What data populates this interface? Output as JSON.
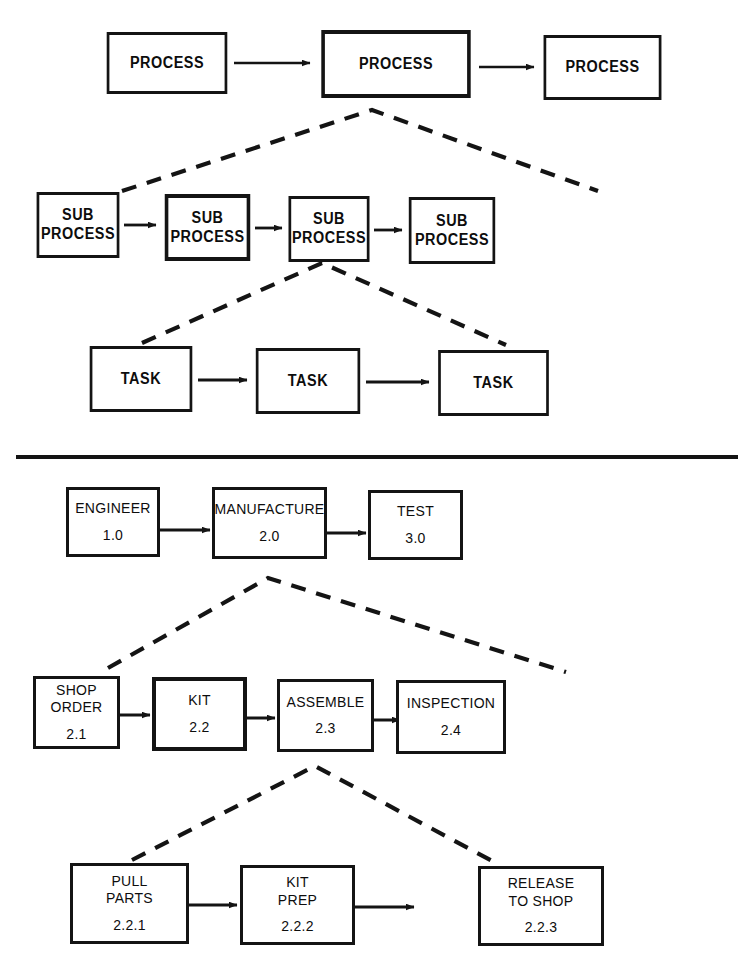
{
  "diagram": {
    "background_color": "#ffffff",
    "line_color": "#141414",
    "upper": {
      "caption": "Generic process hierarchy",
      "levels": [
        {
          "name": "process-level",
          "nodes": [
            {
              "label": "PROCESS"
            },
            {
              "label": "PROCESS"
            },
            {
              "label": "PROCESS"
            }
          ]
        },
        {
          "name": "sub-process-level",
          "nodes": [
            {
              "label_line1": "SUB",
              "label_line2": "PROCESS"
            },
            {
              "label_line1": "SUB",
              "label_line2": "PROCESS"
            },
            {
              "label_line1": "SUB",
              "label_line2": "PROCESS"
            },
            {
              "label_line1": "SUB",
              "label_line2": "PROCESS"
            }
          ]
        },
        {
          "name": "task-level",
          "nodes": [
            {
              "label": "TASK"
            },
            {
              "label": "TASK"
            },
            {
              "label": "TASK"
            }
          ]
        }
      ]
    },
    "lower": {
      "caption": "Worked example: manufacturing decomposition",
      "levels": [
        {
          "name": "level-1",
          "nodes": [
            {
              "label_line1": "ENGINEER",
              "number": "1.0"
            },
            {
              "label_line1": "MANUFACTURE",
              "number": "2.0"
            },
            {
              "label_line1": "TEST",
              "number": "3.0"
            }
          ]
        },
        {
          "name": "level-2",
          "nodes": [
            {
              "label_line1": "SHOP",
              "label_line2": "ORDER",
              "number": "2.1"
            },
            {
              "label_line1": "KIT",
              "number": "2.2"
            },
            {
              "label_line1": "ASSEMBLE",
              "number": "2.3"
            },
            {
              "label_line1": "INSPECTION",
              "number": "2.4"
            }
          ]
        },
        {
          "name": "level-3",
          "nodes": [
            {
              "label_line1": "PULL",
              "label_line2": "PARTS",
              "number": "2.2.1"
            },
            {
              "label_line1": "KIT",
              "label_line2": "PREP",
              "number": "2.2.2"
            },
            {
              "label_line1": "RELEASE",
              "label_line2": "TO SHOP",
              "number": "2.2.3"
            }
          ]
        }
      ]
    }
  }
}
